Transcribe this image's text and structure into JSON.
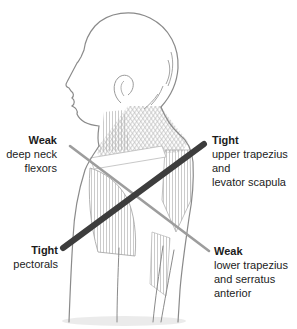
{
  "diagram": {
    "illustration": "upper-body left-facing profile line drawing with muscle hatching",
    "labels": {
      "top_left": {
        "heading": "Weak",
        "lines": [
          "deep neck",
          "flexors"
        ]
      },
      "top_right": {
        "heading": "Tight",
        "lines": [
          "upper trapezius",
          "and",
          "levator scapula"
        ]
      },
      "bottom_left": {
        "heading": "Tight",
        "lines": [
          "pectorals"
        ]
      },
      "bottom_right": {
        "heading": "Weak",
        "lines": [
          "lower trapezius",
          "and serratus",
          "anterior"
        ]
      }
    },
    "lines": {
      "tight_axis": {
        "connects": [
          "Tight upper trapezius and levator scapula",
          "Tight pectorals"
        ],
        "color": "#3d3d3d",
        "weight": "thick"
      },
      "weak_axis": {
        "connects": [
          "Weak deep neck flexors",
          "Weak lower trapezius and serratus anterior"
        ],
        "color": "#9d9d9d",
        "weight": "thin"
      }
    },
    "colors": {
      "background": "#ffffff",
      "outline": "#8a8a8a",
      "muscle_hatch": "#b5b5b5",
      "text": "#1c1c1c"
    }
  }
}
